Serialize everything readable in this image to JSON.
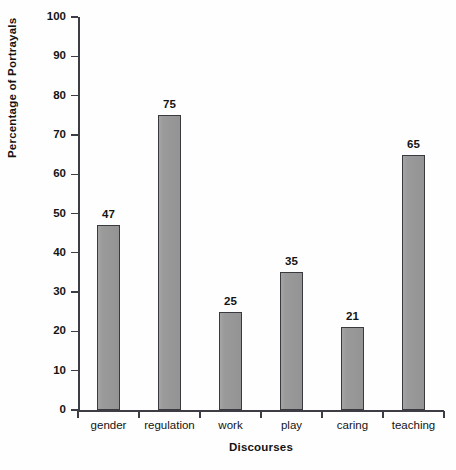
{
  "chart_data": {
    "type": "bar",
    "title": "",
    "xlabel": "Discourses",
    "ylabel": "Percentage of Portrayals",
    "categories": [
      "gender",
      "regulation",
      "work",
      "play",
      "caring",
      "teaching"
    ],
    "values": [
      47,
      75,
      25,
      35,
      21,
      65
    ],
    "value_labels": [
      "47",
      "75",
      "25",
      "35",
      "21",
      "65"
    ],
    "ylim": [
      0,
      100
    ],
    "ytick_labels": [
      "100",
      "90",
      "80",
      "70",
      "60",
      "50",
      "40",
      "30",
      "20",
      "10",
      "0"
    ],
    "ytick_values": [
      100,
      90,
      80,
      70,
      60,
      50,
      40,
      30,
      20,
      10,
      0
    ],
    "grid": false,
    "legend": null,
    "series": [
      {
        "name": "Percentage of Portrayals",
        "values": [
          47,
          75,
          25,
          35,
          21,
          65
        ]
      }
    ],
    "colors": {
      "bar_fill": "#9a9a9a",
      "bar_stroke": "#3a3a3e",
      "axis": "#3d3d46",
      "text": "#141414",
      "background": "#fefefe"
    }
  }
}
